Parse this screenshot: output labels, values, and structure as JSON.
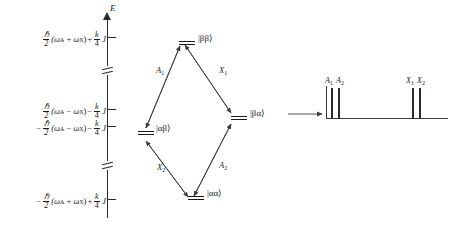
{
  "figure": {
    "kind": "nmr-ax-energy-level-diagram",
    "energy_axis": {
      "axis_label": "E",
      "levels": [
        {
          "id": "bb",
          "sign": "",
          "prefactor_num": "ℏ",
          "prefactor_den": "2",
          "bracket": "(ω",
          "sub_a": "A",
          "operator": "+",
          "omega_x": "ω",
          "sub_x": "X",
          "close": ")",
          "second_sign": "+",
          "coef_num": "k",
          "coef_den": "4",
          "coupling": "J",
          "full_text": "ℏ/2 (ωA + ωX) + k/4 J"
        },
        {
          "id": "ba",
          "sign": "",
          "prefactor_num": "ℏ",
          "prefactor_den": "2",
          "bracket": "(ω",
          "sub_a": "A",
          "operator": "−",
          "omega_x": "ω",
          "sub_x": "X",
          "close": ")",
          "second_sign": "−",
          "coef_num": "k",
          "coef_den": "4",
          "coupling": "J",
          "full_text": "ℏ/2 (ωA − ωX) − k/4 J"
        },
        {
          "id": "ab",
          "sign": "−",
          "prefactor_num": "ℏ",
          "prefactor_den": "2",
          "bracket": "(ω",
          "sub_a": "A",
          "operator": "−",
          "omega_x": "ω",
          "sub_x": "X",
          "close": ")",
          "second_sign": "−",
          "coef_num": "k",
          "coef_den": "4",
          "coupling": "J",
          "full_text": "−ℏ/2 (ωA − ωX) − k/4 J"
        },
        {
          "id": "aa",
          "sign": "−",
          "prefactor_num": "ℏ",
          "prefactor_den": "2",
          "bracket": "(ω",
          "sub_a": "A",
          "operator": "+",
          "omega_x": "ω",
          "sub_x": "X",
          "close": ")",
          "second_sign": "+",
          "coef_num": "k",
          "coef_den": "4",
          "coupling": "J",
          "full_text": "−ℏ/2 (ωA + ωX) + k/4 J"
        }
      ]
    },
    "states": [
      {
        "id": "bb",
        "label": "|ββ⟩"
      },
      {
        "id": "ba",
        "label": "|βα⟩"
      },
      {
        "id": "ab",
        "label": "|αβ⟩"
      },
      {
        "id": "aa",
        "label": "|αα⟩"
      }
    ],
    "transitions": [
      {
        "id": "A1",
        "label": "A",
        "sub": "1",
        "from": "ab",
        "to": "bb"
      },
      {
        "id": "X1",
        "label": "X",
        "sub": "1",
        "from": "bb",
        "to": "ba"
      },
      {
        "id": "X2",
        "label": "X",
        "sub": "2",
        "from": "ab",
        "to": "aa"
      },
      {
        "id": "A2",
        "label": "A",
        "sub": "2",
        "from": "aa",
        "to": "ba"
      }
    ],
    "spectrum": {
      "peaks": [
        {
          "id": "A1",
          "label": "A",
          "sub": "1"
        },
        {
          "id": "A2",
          "label": "A",
          "sub": "2"
        },
        {
          "id": "X1",
          "label": "X",
          "sub": "1"
        },
        {
          "id": "X2",
          "label": "X",
          "sub": "2"
        }
      ],
      "group_left_label": "A₁ A₂",
      "group_right_label": "X₁ X₂"
    },
    "colors": {
      "ink": "#1a1a1a",
      "line": "#2a2a2a",
      "background": "#ffffff"
    }
  }
}
